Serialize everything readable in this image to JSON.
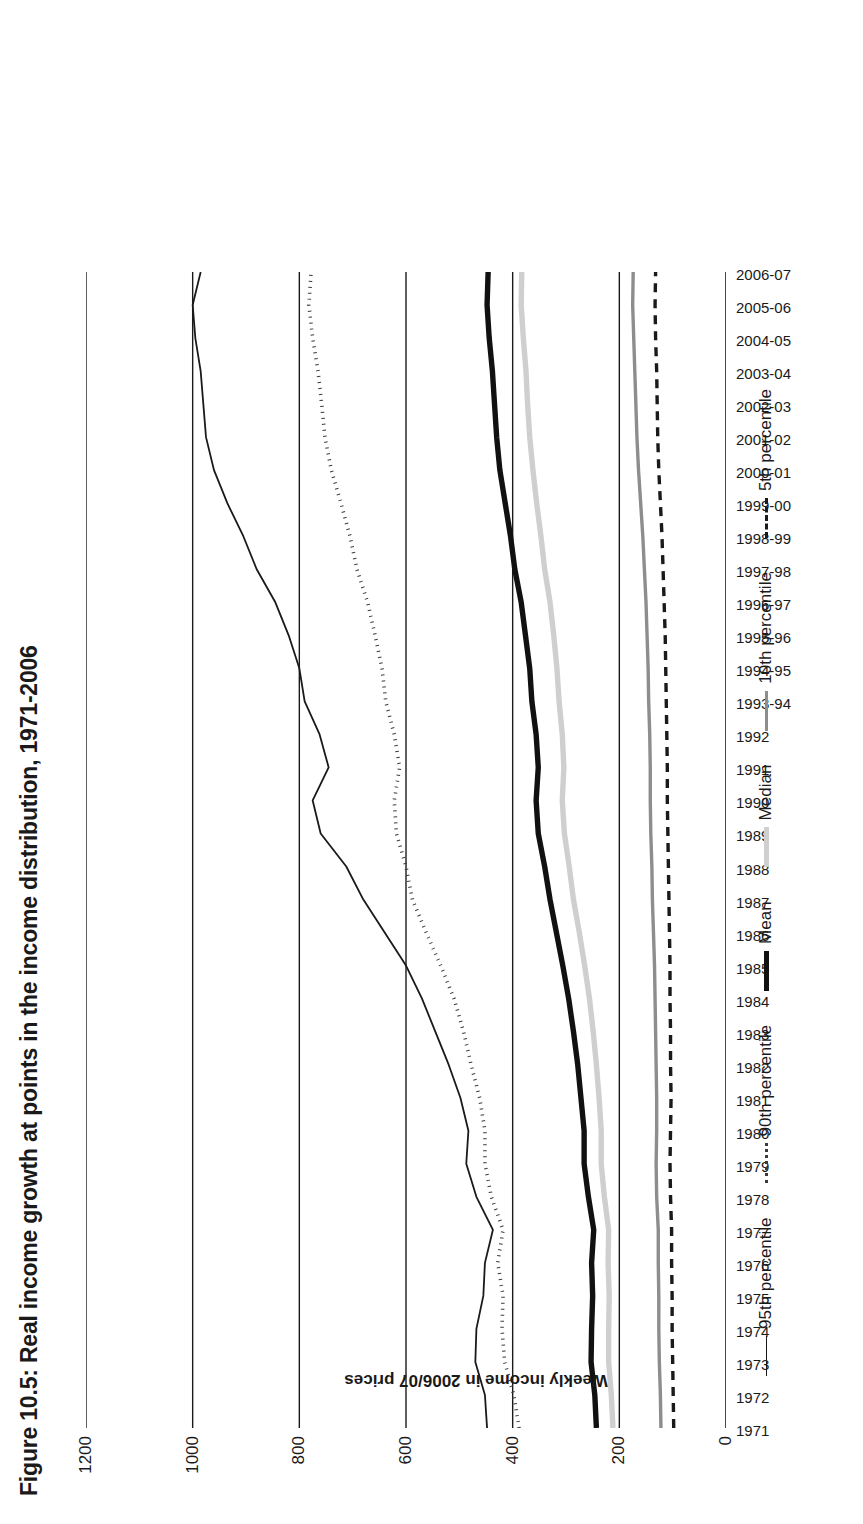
{
  "figure": {
    "title": "Figure 10.5: Real income growth at points in the income distribution, 1971-2006"
  },
  "axes": {
    "ylabel": "Weekly income in 2006/07 prices",
    "xlabel": ""
  },
  "legend": {
    "items": [
      {
        "label": "95th percentile",
        "style": "sw-95",
        "color": "#1a1a1a"
      },
      {
        "label": "90th percentile",
        "style": "sw-90",
        "color": "#3a3a3a"
      },
      {
        "label": "Mean",
        "style": "sw-mean",
        "color": "#111111"
      },
      {
        "label": "Median",
        "style": "sw-median",
        "color": "#cfcfcf"
      },
      {
        "label": "10th percentile",
        "style": "sw-10",
        "color": "#8d8d8d"
      },
      {
        "label": "5th percentile",
        "style": "sw-5",
        "color": "#1a1a1a"
      }
    ]
  },
  "chart_data": {
    "type": "line",
    "title": "Figure 10.5: Real income growth at points in the income distribution, 1971-2006",
    "xlabel": "",
    "ylabel": "Weekly income in 2006/07 prices",
    "ylim": [
      0,
      1200
    ],
    "yticks": [
      0,
      200,
      400,
      600,
      800,
      1000,
      1200
    ],
    "grid": "vertical-only",
    "legend_position": "bottom",
    "categories": [
      "1971",
      "1972",
      "1973",
      "1974",
      "1975",
      "1976",
      "1977",
      "1978",
      "1979",
      "1980",
      "1981",
      "1982",
      "1983",
      "1984",
      "1985",
      "1986",
      "1987",
      "1988",
      "1989",
      "1990",
      "1991",
      "1992",
      "1993-94",
      "1994-95",
      "1995-96",
      "1996-97",
      "1997-98",
      "1998-99",
      "1999-00",
      "2000-01",
      "2001-02",
      "2002-03",
      "2003-04",
      "2004-05",
      "2005-06",
      "2006-07"
    ],
    "series": [
      {
        "name": "95th percentile",
        "values": [
          448,
          452,
          470,
          468,
          455,
          452,
          437,
          468,
          487,
          483,
          498,
          520,
          545,
          570,
          600,
          640,
          680,
          712,
          760,
          775,
          745,
          762,
          790,
          800,
          820,
          845,
          880,
          905,
          935,
          960,
          975,
          980,
          985,
          995,
          1000,
          985
        ]
      },
      {
        "name": "90th percentile",
        "values": [
          388,
          398,
          415,
          420,
          418,
          428,
          418,
          440,
          452,
          452,
          462,
          478,
          492,
          510,
          535,
          562,
          588,
          600,
          618,
          622,
          612,
          622,
          638,
          645,
          658,
          672,
          692,
          705,
          722,
          740,
          752,
          758,
          765,
          775,
          782,
          778
        ]
      },
      {
        "name": "Mean",
        "values": [
          243,
          246,
          253,
          252,
          250,
          252,
          248,
          258,
          266,
          266,
          272,
          278,
          286,
          295,
          306,
          318,
          330,
          340,
          352,
          356,
          352,
          356,
          364,
          368,
          376,
          384,
          396,
          404,
          414,
          424,
          430,
          434,
          438,
          444,
          448,
          446
        ]
      },
      {
        "name": "Median",
        "values": [
          212,
          215,
          220,
          220,
          219,
          221,
          220,
          228,
          234,
          234,
          238,
          243,
          249,
          256,
          265,
          275,
          286,
          294,
          303,
          307,
          304,
          307,
          313,
          317,
          323,
          330,
          340,
          347,
          355,
          362,
          368,
          372,
          375,
          380,
          384,
          383
        ]
      },
      {
        "name": "10th percentile",
        "values": [
          122,
          123,
          125,
          126,
          126,
          127,
          127,
          130,
          131,
          130,
          130,
          131,
          132,
          133,
          134,
          136,
          138,
          139,
          141,
          142,
          142,
          143,
          145,
          146,
          148,
          150,
          153,
          156,
          160,
          164,
          167,
          169,
          171,
          173,
          175,
          174
        ]
      },
      {
        "name": "5th percentile",
        "values": [
          98,
          99,
          100,
          101,
          101,
          102,
          102,
          104,
          105,
          104,
          103,
          104,
          104,
          105,
          105,
          106,
          107,
          108,
          109,
          110,
          110,
          111,
          112,
          113,
          114,
          116,
          118,
          120,
          123,
          126,
          128,
          129,
          130,
          132,
          133,
          132
        ]
      }
    ]
  }
}
